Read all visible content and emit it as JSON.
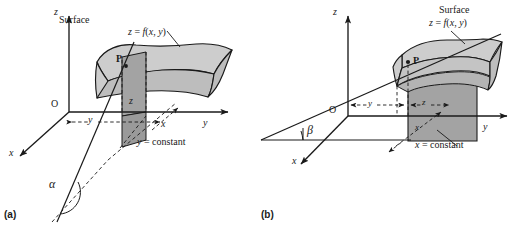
{
  "figure": {
    "kind": "geometric-interpretation-of-partial-derivatives",
    "colors": {
      "ink": "#1a1a1a",
      "surface_light": "#cdcdcd",
      "surface_mid": "#bdbdbd",
      "slab_dark": "#a3a3a3",
      "background": "#ffffff"
    }
  },
  "panels": [
    {
      "tag": "(a)",
      "name": "partial-derivative-with-respect-to-x",
      "axes": {
        "x": "x",
        "y": "y",
        "z": "z",
        "origin": "O"
      },
      "surface": {
        "title": "Surface",
        "equation": "z = f(x, y)"
      },
      "point_label": "P",
      "height_label": "z",
      "distance_labels": {
        "y": "y",
        "x": "x"
      },
      "section_label": "y = constant",
      "angle_label": "α"
    },
    {
      "tag": "(b)",
      "name": "partial-derivative-with-respect-to-y",
      "axes": {
        "x": "x",
        "y": "y",
        "z": "z",
        "origin": "O"
      },
      "surface": {
        "title": "Surface",
        "equation": "z = f(x, y)"
      },
      "point_label": "P",
      "height_label": "z",
      "distance_labels": {
        "y": "y",
        "x": "x"
      },
      "section_label": "x = constant",
      "angle_label": "β"
    }
  ]
}
